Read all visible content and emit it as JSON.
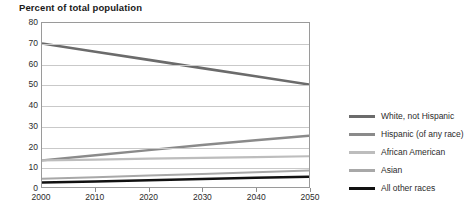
{
  "title": "Percent of total population",
  "chart_data": {
    "type": "line",
    "title": "Percent of total population",
    "xlabel": "",
    "ylabel": "",
    "x": [
      2000,
      2010,
      2020,
      2030,
      2040,
      2050
    ],
    "xlim": [
      2000,
      2050
    ],
    "ylim": [
      0,
      80
    ],
    "ytick_labels": [
      "80",
      "70",
      "60",
      "50",
      "40",
      "30",
      "20",
      "10",
      "0"
    ],
    "yticks": [
      80,
      70,
      60,
      50,
      40,
      30,
      20,
      10,
      0
    ],
    "xtick_labels": [
      "2000",
      "2010",
      "2020",
      "2030",
      "2040",
      "2050"
    ],
    "grid": true,
    "legend_position": "right",
    "series": [
      {
        "name": "White, not Hispanic",
        "color": "#6b6b6b",
        "width": 2.6,
        "values": [
          70,
          66,
          62,
          58,
          54,
          50
        ]
      },
      {
        "name": "Hispanic (of any race)",
        "color": "#8a8a8a",
        "width": 2.4,
        "values": [
          13,
          15.5,
          18,
          20.5,
          22.8,
          25
        ]
      },
      {
        "name": "African American",
        "color": "#bdbdbd",
        "width": 2.2,
        "values": [
          13,
          13.4,
          13.8,
          14.2,
          14.6,
          15
        ]
      },
      {
        "name": "Asian",
        "color": "#a8a8a8",
        "width": 2.0,
        "values": [
          4,
          4.8,
          5.6,
          6.4,
          7.2,
          8
        ]
      },
      {
        "name": "All other races",
        "color": "#111111",
        "width": 2.4,
        "values": [
          2.2,
          2.7,
          3.3,
          3.9,
          4.5,
          5
        ]
      }
    ]
  },
  "legend": {
    "items": [
      {
        "label": "White, not Hispanic",
        "color": "#6b6b6b"
      },
      {
        "label": "Hispanic (of any race)",
        "color": "#8a8a8a"
      },
      {
        "label": "African American",
        "color": "#bdbdbd"
      },
      {
        "label": "Asian",
        "color": "#a8a8a8"
      },
      {
        "label": "All other races",
        "color": "#111111"
      }
    ]
  }
}
